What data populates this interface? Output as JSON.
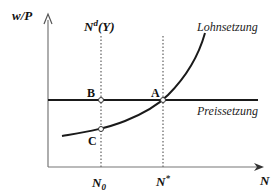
{
  "diagram": {
    "y_axis_label": "w/P",
    "x_axis_label": "N",
    "labor_demand_label": "N",
    "labor_demand_sup": "d",
    "labor_demand_arg": "(Y)",
    "wage_setting_label": "Lohnsetzung",
    "price_setting_label": "Preissetzung",
    "points": {
      "a": "A",
      "b": "B",
      "c": "C"
    },
    "x_ticks": {
      "n0": "N",
      "n0_sub": "0",
      "nstar": "N",
      "nstar_sup": "*"
    },
    "colors": {
      "line": "#1a1a1a",
      "axis": "#555555",
      "dotted": "#777777"
    }
  }
}
